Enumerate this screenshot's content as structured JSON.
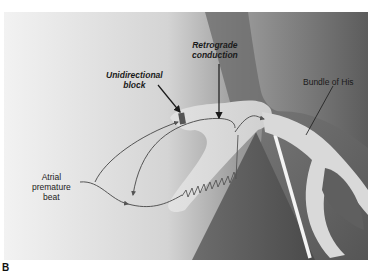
{
  "figure": {
    "panel_letter": "B",
    "labels": {
      "unidirectional_block": [
        "Unidirectional",
        "block"
      ],
      "retrograde_conduction": [
        "Retrograde",
        "conduction"
      ],
      "bundle_of_his": "Bundle of His",
      "atrial_premature_beat": [
        "Atrial",
        "premature",
        "beat"
      ]
    },
    "colors": {
      "background_light": "#e9e9e9",
      "tissue_dark": "#5a5a5a",
      "pathway": "#d6d6d6",
      "arrow": "#1a1a1a",
      "signal_path": "#555555"
    }
  }
}
